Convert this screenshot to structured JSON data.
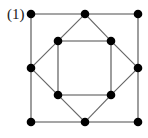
{
  "figure": {
    "label": "(1)",
    "caption_position": "top-left",
    "background_color": "#ffffff",
    "width": 148,
    "height": 138
  },
  "style": {
    "edge_color": "#666666",
    "edge_color_dark": "#4d4d4d",
    "edge_width": 1.1,
    "vertex_color": "#000000",
    "vertex_radius": 4.3,
    "label_color": "#1a1a1a"
  },
  "chart_data": {
    "type": "diagram",
    "title": "(1)",
    "vertices": [
      {
        "id": "outer-top-left",
        "name": "outer square top-left corner",
        "x": 31,
        "y": 14
      },
      {
        "id": "outer-top-mid",
        "name": "outer square top midpoint",
        "x": 85,
        "y": 14
      },
      {
        "id": "outer-top-right",
        "name": "outer square top-right corner",
        "x": 138,
        "y": 14
      },
      {
        "id": "outer-right-mid",
        "name": "outer square right midpoint",
        "x": 138,
        "y": 68
      },
      {
        "id": "outer-bottom-right",
        "name": "outer square bottom-right corner",
        "x": 138,
        "y": 122
      },
      {
        "id": "outer-bottom-mid",
        "name": "outer square bottom midpoint",
        "x": 85,
        "y": 122
      },
      {
        "id": "outer-bottom-left",
        "name": "outer square bottom-left corner",
        "x": 31,
        "y": 122
      },
      {
        "id": "outer-left-mid",
        "name": "outer square left midpoint",
        "x": 31,
        "y": 68
      },
      {
        "id": "inner-top-left",
        "name": "inner square top-left corner",
        "x": 58,
        "y": 41
      },
      {
        "id": "inner-top-right",
        "name": "inner square top-right corner",
        "x": 111,
        "y": 41
      },
      {
        "id": "inner-bottom-right",
        "name": "inner square bottom-right corner",
        "x": 111,
        "y": 95
      },
      {
        "id": "inner-bottom-left",
        "name": "inner square bottom-left corner",
        "x": 58,
        "y": 95
      }
    ],
    "edges": [
      {
        "from": "outer-top-left",
        "to": "outer-top-mid",
        "group": "outer-square"
      },
      {
        "from": "outer-top-mid",
        "to": "outer-top-right",
        "group": "outer-square"
      },
      {
        "from": "outer-top-right",
        "to": "outer-right-mid",
        "group": "outer-square"
      },
      {
        "from": "outer-right-mid",
        "to": "outer-bottom-right",
        "group": "outer-square"
      },
      {
        "from": "outer-bottom-right",
        "to": "outer-bottom-mid",
        "group": "outer-square"
      },
      {
        "from": "outer-bottom-mid",
        "to": "outer-bottom-left",
        "group": "outer-square"
      },
      {
        "from": "outer-bottom-left",
        "to": "outer-left-mid",
        "group": "outer-square"
      },
      {
        "from": "outer-left-mid",
        "to": "outer-top-left",
        "group": "outer-square"
      },
      {
        "from": "outer-top-mid",
        "to": "inner-top-right",
        "group": "diamond"
      },
      {
        "from": "inner-top-right",
        "to": "outer-right-mid",
        "group": "diamond"
      },
      {
        "from": "outer-right-mid",
        "to": "inner-bottom-right",
        "group": "diamond"
      },
      {
        "from": "inner-bottom-right",
        "to": "outer-bottom-mid",
        "group": "diamond"
      },
      {
        "from": "outer-bottom-mid",
        "to": "inner-bottom-left",
        "group": "diamond"
      },
      {
        "from": "inner-bottom-left",
        "to": "outer-left-mid",
        "group": "diamond"
      },
      {
        "from": "outer-left-mid",
        "to": "inner-top-left",
        "group": "diamond"
      },
      {
        "from": "inner-top-left",
        "to": "outer-top-mid",
        "group": "diamond"
      },
      {
        "from": "inner-top-left",
        "to": "inner-top-right",
        "group": "inner-square"
      },
      {
        "from": "inner-top-right",
        "to": "inner-bottom-right",
        "group": "inner-square"
      },
      {
        "from": "inner-bottom-right",
        "to": "inner-bottom-left",
        "group": "inner-square"
      },
      {
        "from": "inner-bottom-left",
        "to": "inner-top-left",
        "group": "inner-square"
      }
    ],
    "vertex_count": 12,
    "edge_count": 20
  }
}
